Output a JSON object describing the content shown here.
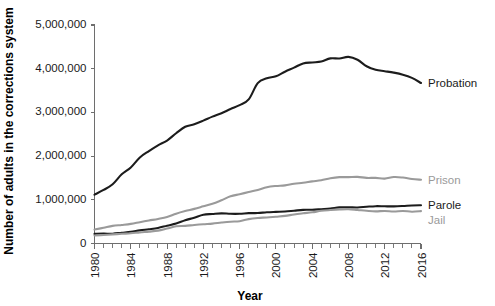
{
  "chart_data": {
    "type": "line",
    "title": "",
    "xlabel": "Year",
    "ylabel": "Number of adults in the corrections system",
    "xlim": [
      1980,
      2016
    ],
    "ylim": [
      0,
      5000000
    ],
    "grid": false,
    "legend_position": "right-inline",
    "x_tick_labels": [
      "1980",
      "1984",
      "1988",
      "1992",
      "1996",
      "2000",
      "2004",
      "2008",
      "2012",
      "2016"
    ],
    "x_tick_values": [
      1980,
      1984,
      1988,
      1992,
      1996,
      2000,
      2004,
      2008,
      2012,
      2016
    ],
    "x_minor_tick_step": 1,
    "y_tick_labels": [
      "0",
      "1,000,000",
      "2,000,000",
      "3,000,000",
      "4,000,000",
      "5,000,000"
    ],
    "y_tick_values": [
      0,
      1000000,
      2000000,
      3000000,
      4000000,
      5000000
    ],
    "x": [
      1980,
      1981,
      1982,
      1983,
      1984,
      1985,
      1986,
      1987,
      1988,
      1989,
      1990,
      1991,
      1992,
      1993,
      1994,
      1995,
      1996,
      1997,
      1998,
      1999,
      2000,
      2001,
      2002,
      2003,
      2004,
      2005,
      2006,
      2007,
      2008,
      2009,
      2010,
      2011,
      2012,
      2013,
      2014,
      2015,
      2016
    ],
    "series": [
      {
        "name": "Probation",
        "color": "#1c1c1c",
        "label_color": "#1a1a1a",
        "values": [
          1118097,
          1225934,
          1357264,
          1582947,
          1740948,
          1968712,
          2114621,
          2247158,
          2356483,
          2522125,
          2670234,
          2728472,
          2811611,
          2903061,
          2981022,
          3077861,
          3164996,
          3296513,
          3670441,
          3779922,
          3826209,
          3931731,
          4024067,
          4120012,
          4143792,
          4162536,
          4236800,
          4234471,
          4270917,
          4203967,
          4055514,
          3973800,
          3942800,
          3910600,
          3864100,
          3789800,
          3673100
        ],
        "legend_label_position": {
          "x": 2016,
          "y": 3900000
        }
      },
      {
        "name": "Prison",
        "color": "#9a9a9a",
        "label_color": "#9a9a9a",
        "values": [
          319598,
          360029,
          402914,
          423898,
          448264,
          487593,
          526436,
          562814,
          607766,
          683367,
          743382,
          792535,
          850566,
          909381,
          990147,
          1078542,
          1127528,
          1176564,
          1224469,
          1287172,
          1316333,
          1330980,
          1367547,
          1390279,
          1421345,
          1448344,
          1492973,
          1517867,
          1518559,
          1524513,
          1500936,
          1501358,
          1483900,
          1520400,
          1508600,
          1476800,
          1459500
        ],
        "legend_label_position": {
          "x": 2016,
          "y": 1480000
        }
      },
      {
        "name": "Parole",
        "color": "#1c1c1c",
        "label_color": "#1a1a1a",
        "values": [
          220438,
          225539,
          224604,
          246440,
          266992,
          300203,
          325638,
          355505,
          407977,
          456803,
          531407,
          590442,
          658601,
          676100,
          690371,
          679421,
          679733,
          694787,
          696385,
          714457,
          723898,
          732333,
          750934,
          769925,
          771852,
          784408,
          798202,
          826097,
          828169,
          824365,
          840676,
          853900,
          851200,
          849500,
          857700,
          870500,
          874800
        ],
        "legend_label_position": {
          "x": 2016,
          "y": 900000
        }
      },
      {
        "name": "Jail",
        "color": "#9a9a9a",
        "label_color": "#9a9a9a",
        "values": [
          182288,
          195085,
          207853,
          221815,
          233018,
          254986,
          272736,
          294092,
          341893,
          393303,
          403019,
          424129,
          441781,
          455500,
          479800,
          499300,
          510400,
          557974,
          584372,
          596485,
          613534,
          631240,
          665475,
          691301,
          713990,
          747529,
          765819,
          780174,
          785533,
          767434,
          748728,
          735601,
          744500,
          731200,
          744600,
          728200,
          740700
        ],
        "legend_label_position": {
          "x": 2016,
          "y": 650000
        }
      }
    ]
  },
  "legend": {
    "items": [
      {
        "label": "Probation",
        "color": "#1c1c1c"
      },
      {
        "label": "Prison",
        "color": "#9a9a9a"
      },
      {
        "label": "Parole",
        "color": "#1c1c1c"
      },
      {
        "label": "Jail",
        "color": "#9a9a9a"
      }
    ]
  },
  "axes": {
    "x_title": "Year",
    "y_title": "Number of adults in the corrections system"
  }
}
